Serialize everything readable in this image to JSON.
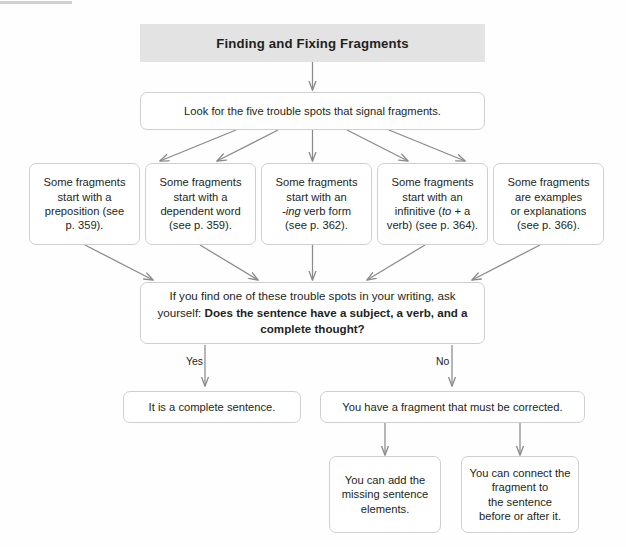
{
  "title": "Finding and Fixing Fragments",
  "banner": {
    "label": "Finding and Fixing Fragments"
  },
  "steps": {
    "intro": "Look for the five trouble spots that signal fragments."
  },
  "trouble_spots": [
    {
      "id": "preposition",
      "line1": "Some fragments",
      "line2": "start with a",
      "line3": "preposition (see",
      "line4": "p. 359)."
    },
    {
      "id": "dependent-word",
      "line1": "Some fragments",
      "line2": "start with a",
      "line3": "dependent word",
      "line4": "(see p. 359)."
    },
    {
      "id": "ing-verb-form",
      "line1": "Some fragments",
      "line2": "start with an",
      "line3_italic": "-ing",
      "line3_rest": " verb form",
      "line4": "(see p. 362)."
    },
    {
      "id": "infinitive",
      "line1": "Some fragments",
      "line2": "start with an",
      "line3_pre": "infinitive (",
      "line3_italic": "to",
      "line3_rest": " + a",
      "line4": "verb) (see p. 364)."
    },
    {
      "id": "examples-explanations",
      "line1": "Some fragments",
      "line2": "are examples",
      "line3": "or explanations",
      "line4": "(see p. 366)."
    }
  ],
  "question": {
    "normal_text": "If you find one of these trouble spots in your writing, ask yourself: ",
    "bold_text": "Does the sentence have a subject, a verb, and a complete thought?"
  },
  "branches": {
    "yes_label": "Yes",
    "no_label": "No"
  },
  "outcomes": {
    "yes": "It is a complete sentence.",
    "no": "You have a fragment that must be corrected."
  },
  "fixes": [
    {
      "id": "add-missing-elements",
      "line1": "You can add the",
      "line2": "missing sentence",
      "line3": "elements."
    },
    {
      "id": "connect-fragment",
      "line1": "You can connect the",
      "line2": "fragment to",
      "line3": "the sentence",
      "line4": "before or after it."
    }
  ],
  "colors": {
    "banner_fill": "#e3e3e3",
    "box_border": "#cfcfcf",
    "text": "#231f20",
    "arrow": "#808080",
    "background": "#fefefe"
  }
}
